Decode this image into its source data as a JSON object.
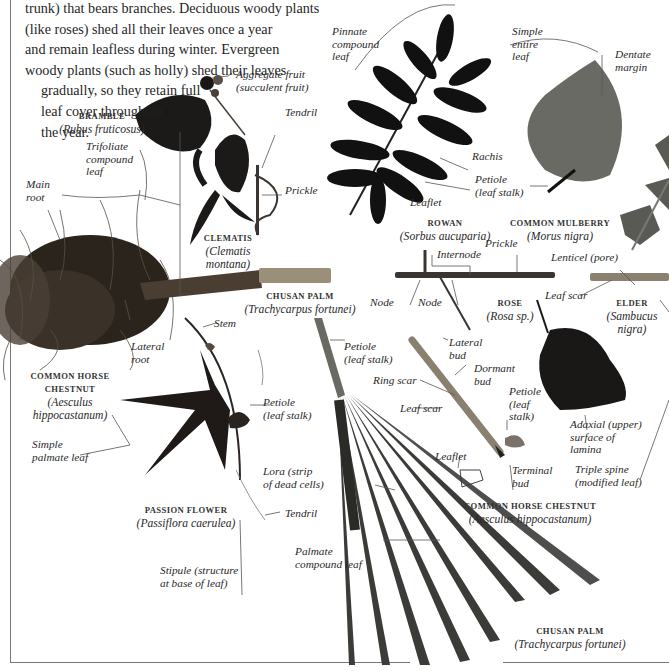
{
  "intro_text": {
    "lines": [
      "trunk) that bears branches. Deciduous woody plants",
      "(like roses) shed all their leaves once a year",
      "and remain leafless during winter. Evergreen",
      "woody plants (such as holly) shed their leaves",
      "gradually, so they retain full",
      "leaf cover throughout",
      "the year."
    ]
  },
  "specimens": {
    "bramble": {
      "name": "BRAMBLE",
      "latin": "(Rubus fruticosus)"
    },
    "clematis": {
      "name": "CLEMATIS",
      "latin1": "(Clematis",
      "latin2": "montana)"
    },
    "horse_chestnut_root": {
      "name1": "COMMON HORSE",
      "name2": "CHESTNUT",
      "latin1": "(Aesculus",
      "latin2": "hippocastanum)"
    },
    "chusan_palm_stem": {
      "name": "CHUSAN PALM",
      "latin": "(Trachycarpus fortunei)"
    },
    "rowan": {
      "name": "ROWAN",
      "latin": "(Sorbus aucuparia)"
    },
    "mulberry": {
      "name": "COMMON MULBERRY",
      "latin": "(Morus nigra)"
    },
    "rose": {
      "name": "ROSE",
      "latin": "(Rosa sp.)"
    },
    "elder": {
      "name": "ELDER",
      "latin1": "(Sambucus",
      "latin2": "nigra)"
    },
    "passion_flower": {
      "name": "PASSION FLOWER",
      "latin": "(Passiflora caerulea)"
    },
    "horse_chestnut_twig": {
      "name": "COMMON HORSE CHESTNUT",
      "latin": "(Aesculus hippocastanum)"
    },
    "chusan_palm_leaf": {
      "name": "CHUSAN PALM",
      "latin": "(Trachycarpus fortunei)"
    }
  },
  "labels": {
    "aggregate_fruit": [
      "Aggregate fruit",
      "(succulent fruit)"
    ],
    "tendril_top": [
      "Tendril"
    ],
    "trifoliate": [
      "Trifoliate",
      "compound",
      "leaf"
    ],
    "prickle_left": [
      "Prickle"
    ],
    "main_root": [
      "Main",
      "root"
    ],
    "lateral_root": [
      "Lateral",
      "root"
    ],
    "pinnate": [
      "Pinnate",
      "compound",
      "leaf"
    ],
    "rachis": [
      "Rachis"
    ],
    "leaflet_rowan": [
      "Leaflet"
    ],
    "simple_entire": [
      "Simple",
      "entire",
      "leaf"
    ],
    "dentate": [
      "Dentate",
      "margin"
    ],
    "petiole_mulberry": [
      "Petiole",
      "(leaf stalk)"
    ],
    "internode": [
      "Internode"
    ],
    "prickle_rose": [
      "Prickle"
    ],
    "node1": [
      "Node"
    ],
    "node2": [
      "Node"
    ],
    "lenticel": [
      "Lenticel (pore)"
    ],
    "leaf_scar_elder": [
      "Leaf scar"
    ],
    "stem": [
      "Stem"
    ],
    "petiole_passion": [
      "Petiole",
      "(leaf stalk)"
    ],
    "simple_palmate": [
      "Simple",
      "palmate leaf"
    ],
    "tendril_bottom": [
      "Tendril"
    ],
    "stipule": [
      "Stipule (structure",
      "at base of leaf)"
    ],
    "petiole_palm": [
      "Petiole",
      "(leaf stalk)"
    ],
    "lora": [
      "Lora (strip",
      "of dead cells)"
    ],
    "palmate_compound": [
      "Palmate",
      "compound leaf"
    ],
    "lateral_bud": [
      "Lateral",
      "bud"
    ],
    "dormant_bud": [
      "Dormant",
      "bud"
    ],
    "ring_scar": [
      "Ring scar"
    ],
    "leaf_scar_twig": [
      "Leaf scar"
    ],
    "petiole_twig": [
      "Petiole",
      "(leaf",
      "stalk)"
    ],
    "leaflet_twig": [
      "Leaflet"
    ],
    "terminal_bud": [
      "Terminal",
      "bud"
    ],
    "adaxial": [
      "Adaxial (upper)",
      "surface of",
      "lamina"
    ],
    "triple_spine": [
      "Triple spine",
      "(modified leaf)"
    ]
  }
}
